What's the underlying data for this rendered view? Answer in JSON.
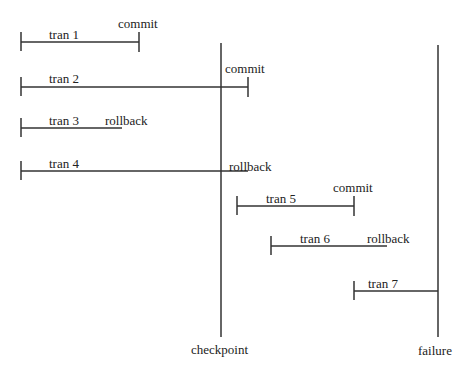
{
  "diagram": {
    "checkpoint": {
      "label": "checkpoint",
      "x": 221
    },
    "failure": {
      "label": "failure",
      "x": 438
    },
    "transactions": [
      {
        "name": "tran 1",
        "end_label": "commit"
      },
      {
        "name": "tran 2",
        "end_label": "commit"
      },
      {
        "name": "tran 3",
        "end_label": "rollback"
      },
      {
        "name": "tran 4",
        "end_label": "rollback"
      },
      {
        "name": "tran 5",
        "end_label": "commit"
      },
      {
        "name": "tran 6",
        "end_label": "rollback"
      },
      {
        "name": "tran 7",
        "end_label": ""
      }
    ]
  }
}
